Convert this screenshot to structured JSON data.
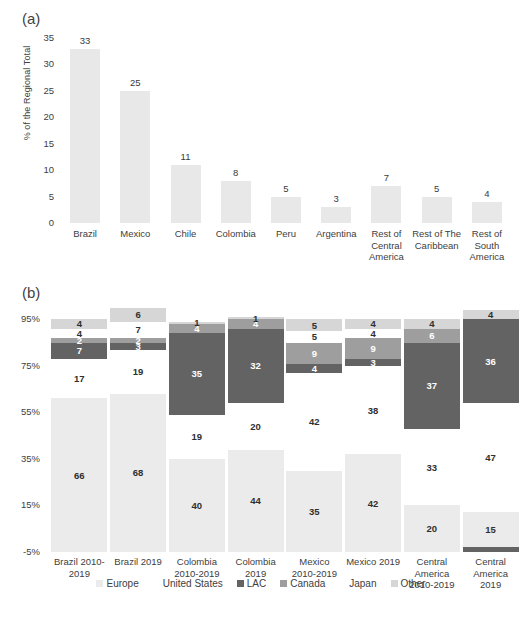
{
  "panel_a": {
    "tag": "(a)",
    "ylabel": "% of the Regional Total",
    "yticks": [
      "35",
      "30",
      "25",
      "20",
      "15",
      "10",
      "5",
      "0"
    ]
  },
  "panel_b": {
    "tag": "(b)",
    "yticks": [
      "95%",
      "75%",
      "55%",
      "35%",
      "15%",
      "-5%"
    ],
    "legend": [
      {
        "label": "Europe",
        "color": "#ebebeb"
      },
      {
        "label": "United States",
        "color": "#ffffff"
      },
      {
        "label": "LAC",
        "color": "#636363"
      },
      {
        "label": "Canada",
        "color": "#9e9e9e"
      },
      {
        "label": "Japan",
        "color": "#ffffff"
      },
      {
        "label": "Other",
        "color": "#d6d6d6"
      }
    ]
  },
  "chart_data": [
    {
      "type": "bar",
      "panel": "(a)",
      "title": "",
      "xlabel": "",
      "ylabel": "% of the Regional Total",
      "ylim": [
        0,
        36
      ],
      "yticks": [
        0,
        5,
        10,
        15,
        20,
        25,
        30,
        35
      ],
      "grid": false,
      "bar_color": "#e8e8e8",
      "categories": [
        "Brazil",
        "Mexico",
        "Chile",
        "Colombia",
        "Peru",
        "Argentina",
        "Rest of Central America",
        "Rest of The Caribbean",
        "Rest of South America"
      ],
      "category_lines": [
        [
          "Brazil"
        ],
        [
          "Mexico"
        ],
        [
          "Chile"
        ],
        [
          "Colombia"
        ],
        [
          "Peru"
        ],
        [
          "Argentina"
        ],
        [
          "Rest of",
          "Central",
          "America"
        ],
        [
          "Rest of The",
          "Caribbean"
        ],
        [
          "Rest of",
          "South",
          "America"
        ]
      ],
      "values": [
        33,
        25,
        11,
        8,
        5,
        3,
        7,
        5,
        4
      ]
    },
    {
      "type": "bar",
      "subtype": "stacked",
      "panel": "(b)",
      "title": "",
      "xlabel": "",
      "ylabel": "",
      "ylim": [
        -5,
        105
      ],
      "yticks": [
        -5,
        15,
        35,
        55,
        75,
        95
      ],
      "ytick_labels": [
        "-5%",
        "15%",
        "35%",
        "55%",
        "75%",
        "95%"
      ],
      "grid": false,
      "legend_position": "bottom",
      "categories": [
        "Brazil 2010-2019",
        "Brazil 2019",
        "Colombia 2010-2019",
        "Colombia 2019",
        "Mexico 2010-2019",
        "Mexico 2019",
        "Central America 2010-2019",
        "Central America 2019"
      ],
      "category_lines": [
        [
          "Brazil 2010-",
          "2019"
        ],
        [
          "Brazil 2019"
        ],
        [
          "Colombia",
          "2010-2019"
        ],
        [
          "Colombia",
          "2019"
        ],
        [
          "Mexico",
          "2010-2019"
        ],
        [
          "Mexico 2019"
        ],
        [
          "Central",
          "America",
          "2010-2019"
        ],
        [
          "Central",
          "America",
          "2019"
        ]
      ],
      "series": [
        {
          "name": "Europe",
          "color": "#ebebeb",
          "values": [
            66,
            68,
            40,
            44,
            35,
            42,
            20,
            15
          ]
        },
        {
          "name": "United States",
          "color": "#ffffff",
          "values": [
            17,
            19,
            19,
            20,
            42,
            38,
            33,
            47
          ]
        },
        {
          "name": "LAC",
          "color": "#636363",
          "values": [
            7,
            3,
            35,
            32,
            4,
            3,
            37,
            36
          ]
        },
        {
          "name": "Canada",
          "color": "#9e9e9e",
          "values": [
            2,
            2,
            4,
            4,
            9,
            9,
            6,
            0
          ]
        },
        {
          "name": "Japan",
          "color": "#ffffff",
          "values": [
            4,
            7,
            0,
            0,
            5,
            4,
            0,
            0
          ]
        },
        {
          "name": "Other",
          "color": "#d6d6d6",
          "values": [
            4,
            6,
            1,
            1,
            5,
            4,
            4,
            4
          ]
        }
      ],
      "columns": [
        {
          "label": "Brazil 2010-2019",
          "segments": [
            {
              "series": "Europe",
              "value": 66,
              "label": "66",
              "show_label": true
            },
            {
              "series": "United States",
              "value": 17,
              "label": "17",
              "show_label": true
            },
            {
              "series": "LAC",
              "value": 7,
              "label": "7",
              "show_label": true
            },
            {
              "series": "Canada",
              "value": 2,
              "label": "2",
              "show_label": true
            },
            {
              "series": "Japan",
              "value": 4,
              "label": "4",
              "show_label": true
            },
            {
              "series": "Other",
              "value": 4,
              "label": "4",
              "show_label": true
            }
          ]
        },
        {
          "label": "Brazil 2019",
          "segments": [
            {
              "series": "Europe",
              "value": 68,
              "label": "68",
              "show_label": true
            },
            {
              "series": "United States",
              "value": 19,
              "label": "19",
              "show_label": true
            },
            {
              "series": "LAC",
              "value": 3,
              "label": "3",
              "show_label": true
            },
            {
              "series": "Canada",
              "value": 2,
              "label": "2",
              "show_label": true
            },
            {
              "series": "Japan",
              "value": 7,
              "label": "7",
              "show_label": true
            },
            {
              "series": "Other",
              "value": 6,
              "label": "6",
              "show_label": true
            }
          ]
        },
        {
          "label": "Colombia 2010-2019",
          "segments": [
            {
              "series": "Europe",
              "value": 40,
              "label": "40",
              "show_label": true
            },
            {
              "series": "United States",
              "value": 19,
              "label": "19",
              "show_label": true
            },
            {
              "series": "LAC",
              "value": 35,
              "label": "35",
              "show_label": true
            },
            {
              "series": "Canada",
              "value": 4,
              "label": "4",
              "show_label": true
            },
            {
              "series": "Japan",
              "value": 0,
              "label": "",
              "show_label": false
            },
            {
              "series": "Other",
              "value": 1,
              "label": "1",
              "show_label": true
            }
          ]
        },
        {
          "label": "Colombia 2019",
          "segments": [
            {
              "series": "Europe",
              "value": 44,
              "label": "44",
              "show_label": true
            },
            {
              "series": "United States",
              "value": 20,
              "label": "20",
              "show_label": true
            },
            {
              "series": "LAC",
              "value": 32,
              "label": "32",
              "show_label": true
            },
            {
              "series": "Canada",
              "value": 4,
              "label": "4",
              "show_label": true
            },
            {
              "series": "Japan",
              "value": 0,
              "label": "",
              "show_label": false
            },
            {
              "series": "Other",
              "value": 1,
              "label": "1",
              "show_label": true
            }
          ]
        },
        {
          "label": "Mexico 2010-2019",
          "segments": [
            {
              "series": "Europe",
              "value": 35,
              "label": "35",
              "show_label": true
            },
            {
              "series": "United States",
              "value": 42,
              "label": "42",
              "show_label": true
            },
            {
              "series": "LAC",
              "value": 4,
              "label": "4",
              "show_label": true
            },
            {
              "series": "Canada",
              "value": 9,
              "label": "9",
              "show_label": true
            },
            {
              "series": "Japan",
              "value": 5,
              "label": "5",
              "show_label": true
            },
            {
              "series": "Other",
              "value": 5,
              "label": "5",
              "show_label": true
            }
          ]
        },
        {
          "label": "Mexico 2019",
          "segments": [
            {
              "series": "Europe",
              "value": 42,
              "label": "42",
              "show_label": true
            },
            {
              "series": "United States",
              "value": 38,
              "label": "38",
              "show_label": true
            },
            {
              "series": "LAC",
              "value": 3,
              "label": "3",
              "show_label": true
            },
            {
              "series": "Canada",
              "value": 9,
              "label": "9",
              "show_label": true
            },
            {
              "series": "Japan",
              "value": 4,
              "label": "4",
              "show_label": true
            },
            {
              "series": "Other",
              "value": 4,
              "label": "4",
              "show_label": true
            }
          ]
        },
        {
          "label": "Central America 2010-2019",
          "segments": [
            {
              "series": "Europe",
              "value": 20,
              "label": "20",
              "show_label": true
            },
            {
              "series": "United States",
              "value": 33,
              "label": "33",
              "show_label": true
            },
            {
              "series": "LAC",
              "value": 37,
              "label": "37",
              "show_label": true
            },
            {
              "series": "Canada",
              "value": 6,
              "label": "6",
              "show_label": true
            },
            {
              "series": "Japan",
              "value": 0,
              "label": "",
              "show_label": false
            },
            {
              "series": "Other",
              "value": 4,
              "label": "4",
              "show_label": true
            }
          ]
        },
        {
          "label": "Central America 2019",
          "segments": [
            {
              "series": "LAC",
              "value": 2,
              "label": "",
              "show_label": false
            },
            {
              "series": "Europe",
              "value": 15,
              "label": "15",
              "show_label": true
            },
            {
              "series": "United States",
              "value": 47,
              "label": "47",
              "show_label": true
            },
            {
              "series": "LAC",
              "value": 36,
              "label": "36",
              "show_label": true
            },
            {
              "series": "Japan",
              "value": 0,
              "label": "",
              "show_label": false
            },
            {
              "series": "Other",
              "value": 4,
              "label": "4",
              "show_label": true
            }
          ]
        }
      ]
    }
  ]
}
